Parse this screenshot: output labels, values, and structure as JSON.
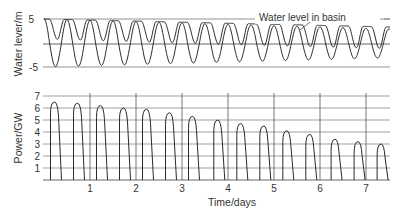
{
  "chart_data": [
    {
      "type": "line",
      "title": "",
      "xlabel": "Time/days",
      "ylabel": "Water lever/m",
      "ylim": [
        -5,
        5
      ],
      "yticks": [
        "5",
        "",
        "-5"
      ],
      "grid": true,
      "annotation": "Water level in basin",
      "series": [
        {
          "name": "Sea / tidal level",
          "description": "sinusoid oscillating between about -5 and +5 m, ~2 cycles per day, amplitude slowly decreasing to about ±3 m by day 7.5"
        },
        {
          "name": "Water level in basin",
          "description": "stays near +5 m (flat tops) then drops to ~+1 m each half-cycle, later range ~+2.5 to -1 m"
        }
      ]
    },
    {
      "type": "line",
      "title": "",
      "xlabel": "Time/days",
      "ylabel": "Power/GW",
      "ylim": [
        0,
        7
      ],
      "yticks": [
        "1",
        "2",
        "3",
        "4",
        "5",
        "6",
        "7"
      ],
      "xticks": [
        "1",
        "2",
        "3",
        "4",
        "5",
        "6",
        "7"
      ],
      "xlim": [
        0,
        7.5
      ],
      "grid": true,
      "series": [
        {
          "name": "Power output",
          "x": [
            0.25,
            0.75,
            1.25,
            1.75,
            2.25,
            2.75,
            3.25,
            3.8,
            4.3,
            4.8,
            5.3,
            5.8,
            6.35,
            6.85,
            7.35
          ],
          "values": [
            6.5,
            6.4,
            6.2,
            6.0,
            5.9,
            5.6,
            5.3,
            5.0,
            4.7,
            4.5,
            4.1,
            3.8,
            3.4,
            3.2,
            3.0
          ]
        }
      ]
    }
  ],
  "top": {
    "ylabel": "Water lever/m",
    "tick_5": "5",
    "tick_m5": "-5",
    "annotation": "Water level in basin"
  },
  "bottom": {
    "ylabel": "Power/GW",
    "yticks": [
      "7",
      "6",
      "5",
      "4",
      "3",
      "2",
      "1"
    ],
    "xticks": [
      "1",
      "2",
      "3",
      "4",
      "5",
      "6",
      "7"
    ],
    "xlabel": "Time/days",
    "peaks": [
      6.5,
      6.4,
      6.2,
      6.0,
      5.9,
      5.6,
      5.3,
      5.0,
      4.7,
      4.5,
      4.1,
      3.8,
      3.4,
      3.2,
      3.0
    ]
  },
  "colors": {
    "line": "#2a2a2a",
    "grid": "#555555"
  }
}
